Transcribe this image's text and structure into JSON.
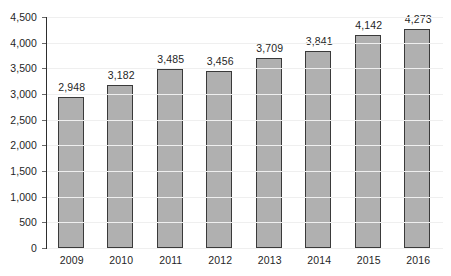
{
  "chart_data": {
    "type": "bar",
    "title": "",
    "subtitle": "",
    "xlabel": "",
    "ylabel": "",
    "categories": [
      "2009",
      "2010",
      "2011",
      "2012",
      "2013",
      "2014",
      "2015",
      "2016"
    ],
    "values": [
      2948,
      3182,
      3485,
      3456,
      3709,
      3841,
      4142,
      4273
    ],
    "value_labels": [
      "2,948",
      "3,182",
      "3,485",
      "3,456",
      "3,709",
      "3,841",
      "4,142",
      "4,273"
    ],
    "ylim": [
      0,
      4500
    ],
    "ytick_values": [
      0,
      500,
      1000,
      1500,
      2000,
      2500,
      3000,
      3500,
      4000,
      4500
    ],
    "ytick_labels": [
      "0",
      "500",
      "1,000",
      "1,500",
      "2,000",
      "2,500",
      "3,000",
      "3,500",
      "4,000",
      "4,500"
    ],
    "grid": true,
    "legend": false,
    "legend_position": "none",
    "colors": {
      "bar_fill": "#b0b0b0",
      "bar_border": "#3a3a3a",
      "axis": "#2e2e2e",
      "gridline": "#efefef",
      "text": "#1f1f1f",
      "background": "#ffffff"
    }
  }
}
